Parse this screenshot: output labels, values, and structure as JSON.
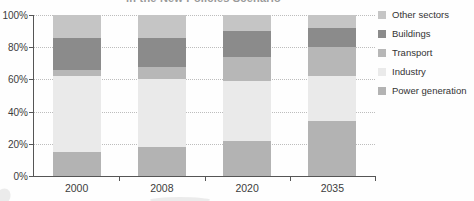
{
  "title_fragment": "in the New Policies Scenario",
  "chart_data": {
    "type": "bar",
    "subtype": "stacked-100-percent",
    "categories": [
      "2000",
      "2008",
      "2020",
      "2035"
    ],
    "series": [
      {
        "name": "Power generation",
        "color_key": "power",
        "values": [
          15,
          18,
          22,
          34
        ]
      },
      {
        "name": "Industry",
        "color_key": "industry",
        "values": [
          47,
          42,
          37,
          28
        ]
      },
      {
        "name": "Transport",
        "color_key": "transport",
        "values": [
          4,
          8,
          15,
          18
        ]
      },
      {
        "name": "Buildings",
        "color_key": "buildings",
        "values": [
          20,
          18,
          16,
          12
        ]
      },
      {
        "name": "Other sectors",
        "color_key": "other",
        "values": [
          14,
          14,
          10,
          8
        ]
      }
    ],
    "stack_order": "bottom-to-top",
    "legend_order_top_to_bottom": [
      "Other sectors",
      "Buildings",
      "Transport",
      "Industry",
      "Power generation"
    ],
    "yticks": [
      100,
      80,
      60,
      40,
      20,
      0
    ],
    "ytick_suffix": "%",
    "ylim": [
      0,
      100
    ],
    "grid": "dotted-horizontal",
    "legend_position": "right",
    "xlabel": "",
    "ylabel": ""
  },
  "colors": {
    "power": "#b3b3b3",
    "industry": "#eaeaea",
    "transport": "#b7b7b7",
    "buildings": "#8b8b8b",
    "other": "#c5c5c5",
    "axis": "#555555",
    "grid": "#bdbdbd",
    "label_text": "#3c3c3c",
    "title_text": "#9a9a9a"
  }
}
